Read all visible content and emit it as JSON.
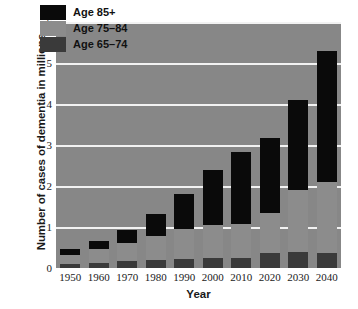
{
  "chart_data": {
    "type": "bar",
    "subtype": "stacked-bar",
    "title": "",
    "xlabel": "Year",
    "ylabel": "Number of cases of dementia in millions",
    "categories": [
      "1950",
      "1960",
      "1970",
      "1980",
      "1990",
      "2000",
      "2010",
      "2020",
      "2030",
      "2040"
    ],
    "ylim": [
      0,
      6
    ],
    "yticks": [
      "6",
      "5",
      "4",
      "3",
      "2",
      "1",
      "0"
    ],
    "ytick_values": [
      6,
      5,
      4,
      3,
      2,
      1,
      0
    ],
    "grid": true,
    "grid_color": "#f2f2f2",
    "legend_position": "top-left",
    "plot_background": "#878787",
    "series": [
      {
        "name": "Age 65–74",
        "color": "#3a3a3a",
        "values": [
          0.1,
          0.13,
          0.16,
          0.19,
          0.22,
          0.24,
          0.25,
          0.37,
          0.4,
          0.37
        ]
      },
      {
        "name": "Age 75–84",
        "color": "#8c8c8c",
        "values": [
          0.21,
          0.33,
          0.44,
          0.58,
          0.73,
          0.82,
          0.82,
          0.98,
          1.5,
          1.72
        ]
      },
      {
        "name": "Age 85+",
        "color": "#0a0a0a",
        "values": [
          0.16,
          0.21,
          0.33,
          0.54,
          0.86,
          1.32,
          1.76,
          1.83,
          2.19,
          3.21
        ]
      }
    ],
    "totals": [
      0.47,
      0.67,
      0.93,
      1.31,
      1.81,
      2.38,
      2.83,
      3.18,
      4.09,
      5.3
    ]
  },
  "legend": {
    "items": [
      {
        "label": "Age 85+",
        "color": "#0a0a0a"
      },
      {
        "label": "Age 75–84",
        "color": "#8c8c8c"
      },
      {
        "label": "Age 65–74",
        "color": "#3a3a3a"
      }
    ]
  }
}
